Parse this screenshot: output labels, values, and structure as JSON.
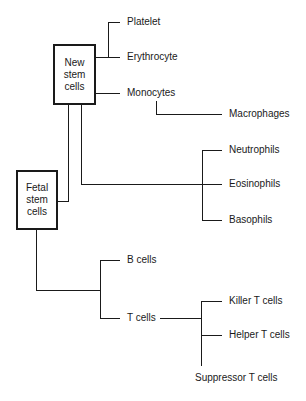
{
  "diagram": {
    "type": "hierarchy",
    "root_nodes": [
      {
        "id": "new_stem",
        "label": "New\nstem\ncells",
        "lines": [
          "New",
          "stem",
          "cells"
        ],
        "children": [
          "Platelet",
          "Erythrocyte",
          "Monocytes",
          "Neutrophils",
          "Eosinophils",
          "Basophils"
        ]
      },
      {
        "id": "fetal_stem",
        "label": "Fetal\nstem\ncells",
        "lines": [
          "Fetal",
          "stem",
          "cells"
        ],
        "children": [
          "B cells",
          "T cells"
        ]
      }
    ],
    "nodes": {
      "platelet": "Platelet",
      "erythrocyte": "Erythrocyte",
      "monocytes": "Monocytes",
      "macrophages": "Macrophages",
      "neutrophils": "Neutrophils",
      "eosinophils": "Eosinophils",
      "basophils": "Basophils",
      "b_cells": "B cells",
      "t_cells": "T cells",
      "killer_t": "Killer T cells",
      "helper_t": "Helper T cells",
      "suppressor_t": "Suppressor T cells"
    },
    "edges": [
      [
        "New stem cells",
        "Platelet"
      ],
      [
        "New stem cells",
        "Erythrocyte"
      ],
      [
        "New stem cells",
        "Monocytes"
      ],
      [
        "Monocytes",
        "Macrophages"
      ],
      [
        "New stem cells",
        "Neutrophils"
      ],
      [
        "New stem cells",
        "Eosinophils"
      ],
      [
        "New stem cells",
        "Basophils"
      ],
      [
        "New stem cells",
        "Fetal stem cells"
      ],
      [
        "Fetal stem cells",
        "B cells"
      ],
      [
        "Fetal stem cells",
        "T cells"
      ],
      [
        "T cells",
        "Killer T cells"
      ],
      [
        "T cells",
        "Helper T cells"
      ],
      [
        "T cells",
        "Suppressor T cells"
      ]
    ],
    "line_color": "#1a1a1a"
  }
}
